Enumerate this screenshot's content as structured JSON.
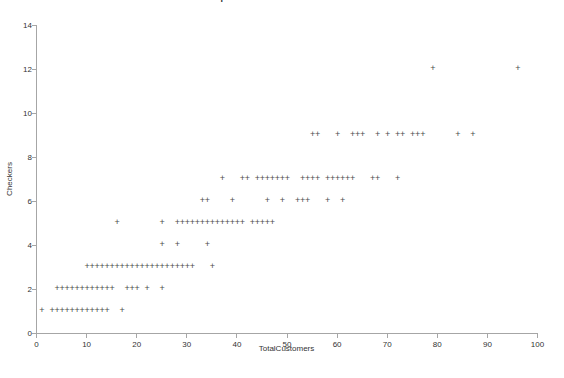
{
  "chart_data": {
    "type": "scatter",
    "title": "Scatterplot of Checkers vs TotalCustomers",
    "xlabel": "TotalCustomers",
    "ylabel": "Checkers",
    "xlim": [
      0,
      100
    ],
    "ylim": [
      0,
      14
    ],
    "xticks": [
      0,
      10,
      20,
      30,
      40,
      50,
      60,
      70,
      80,
      90,
      100
    ],
    "yticks": [
      0,
      2,
      4,
      6,
      8,
      10,
      12,
      14
    ],
    "grid": false,
    "legend": false,
    "marker": "+",
    "marker_color": "#4d4d4d",
    "axis_color": "#a6a6a6",
    "tick_text_color": "#333333",
    "rows": [
      {
        "y": 1,
        "x": [
          1,
          3,
          4,
          5,
          6,
          7,
          8,
          9,
          10,
          11,
          12,
          13,
          14,
          17
        ]
      },
      {
        "y": 2,
        "x": [
          4,
          5,
          6,
          7,
          8,
          9,
          10,
          11,
          12,
          13,
          14,
          15,
          18,
          19,
          20,
          22,
          25
        ]
      },
      {
        "y": 3,
        "x": [
          10,
          11,
          12,
          13,
          14,
          15,
          16,
          17,
          18,
          19,
          20,
          21,
          22,
          23,
          24,
          25,
          26,
          27,
          28,
          29,
          30,
          31,
          35
        ]
      },
      {
        "y": 4,
        "x": [
          25,
          28,
          34
        ]
      },
      {
        "y": 5,
        "x": [
          16,
          25,
          28,
          29,
          30,
          31,
          32,
          33,
          34,
          35,
          36,
          37,
          38,
          39,
          40,
          41,
          43,
          44,
          45,
          46,
          47
        ]
      },
      {
        "y": 6,
        "x": [
          33,
          34,
          39,
          46,
          49,
          52,
          53,
          54,
          58,
          61
        ]
      },
      {
        "y": 7,
        "x": [
          37,
          41,
          42,
          44,
          45,
          46,
          47,
          48,
          49,
          50,
          53,
          54,
          55,
          56,
          58,
          59,
          60,
          61,
          62,
          63,
          67,
          68,
          72
        ]
      },
      {
        "y": 9,
        "x": [
          55,
          56,
          60,
          63,
          64,
          65,
          68,
          70,
          72,
          73,
          75,
          76,
          77,
          84,
          87
        ]
      },
      {
        "y": 12,
        "x": [
          79,
          96
        ]
      }
    ]
  }
}
